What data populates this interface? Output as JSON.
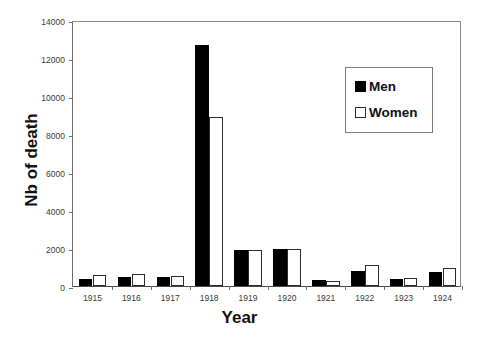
{
  "chart_data": {
    "type": "bar",
    "title": "",
    "xlabel": "Year",
    "ylabel": "Nb of death",
    "categories": [
      "1915",
      "1916",
      "1917",
      "1918",
      "1919",
      "1920",
      "1921",
      "1922",
      "1923",
      "1924"
    ],
    "series": [
      {
        "name": "Men",
        "color": "#000000",
        "values": [
          380,
          450,
          450,
          12700,
          1900,
          1950,
          300,
          800,
          380,
          750
        ]
      },
      {
        "name": "Women",
        "color": "#ffffff",
        "values": [
          580,
          620,
          520,
          8900,
          1900,
          1950,
          250,
          1100,
          400,
          950
        ]
      }
    ],
    "ylim": [
      0,
      14000
    ],
    "yticks": [
      0,
      2000,
      4000,
      6000,
      8000,
      10000,
      12000,
      14000
    ],
    "ytick_labels": [
      "0",
      "2000",
      "4000",
      "6000",
      "8000",
      "10000",
      "12000",
      "14000"
    ],
    "grid": false,
    "legend_position": "upper right"
  },
  "legend": {
    "items": [
      {
        "label": "Men",
        "swatch": "filled-square-icon"
      },
      {
        "label": "Women",
        "swatch": "empty-square-icon"
      }
    ]
  }
}
